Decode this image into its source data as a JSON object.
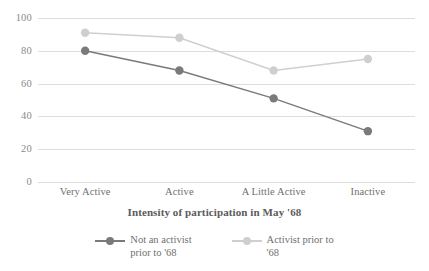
{
  "chart_data": {
    "type": "line",
    "title": "",
    "subtitle": "",
    "xlabel": "Intensity of participation in May '68",
    "ylabel": "",
    "categories": [
      "Very Active",
      "Active",
      "A Little Active",
      "Inactive"
    ],
    "ylim": [
      0,
      100
    ],
    "yticks": [
      0,
      20,
      40,
      60,
      80,
      100
    ],
    "ytick_labels": [
      "0",
      "20",
      "40",
      "60",
      "80",
      "100"
    ],
    "grid": true,
    "legend_position": "bottom",
    "series": [
      {
        "name": "Not an activist prior to '68",
        "legend_line1": "Not an activist",
        "legend_line2": "prior to '68",
        "color": "#7a7a7a",
        "marker": "circle",
        "values": [
          80,
          68,
          51,
          31
        ]
      },
      {
        "name": "Activist prior to '68",
        "legend_line1": "Activist prior to",
        "legend_line2": "'68",
        "color": "#cfcfcf",
        "marker": "circle",
        "values": [
          91,
          88,
          68,
          75
        ]
      }
    ],
    "gridline_color": "#dddddd",
    "text_color": "#6f6f6f"
  }
}
